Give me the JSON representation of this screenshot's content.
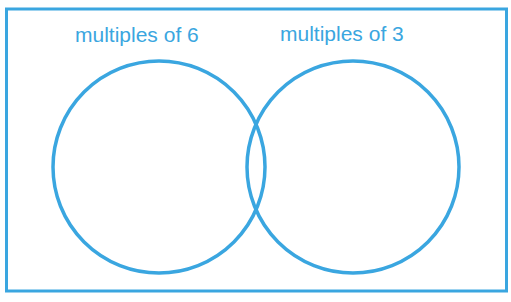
{
  "diagram": {
    "type": "venn",
    "colors": {
      "stroke": "#3aa6e0",
      "text": "#3aa6e0",
      "background": "#ffffff"
    },
    "sets": [
      {
        "label": "multiples of 6",
        "members": []
      },
      {
        "label": "multiples of 3",
        "members": []
      }
    ]
  }
}
